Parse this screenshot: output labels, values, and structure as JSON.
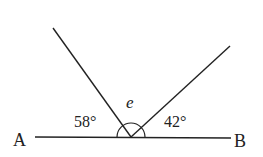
{
  "diagram": {
    "points": {
      "A": {
        "label": "A"
      },
      "B": {
        "label": "B"
      }
    },
    "angles": {
      "left": {
        "label": "58°"
      },
      "middle": {
        "label": "e"
      },
      "right": {
        "label": "42°"
      }
    },
    "colors": {
      "line": "#222222",
      "background": "#ffffff"
    }
  }
}
